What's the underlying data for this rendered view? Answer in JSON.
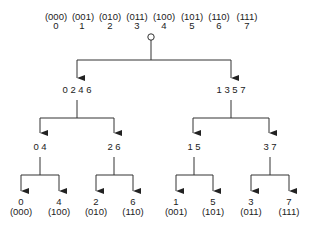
{
  "header": {
    "binary": [
      "(000)",
      "(001)",
      "(010)",
      "(011)",
      "(100)",
      "(101)",
      "(110)",
      "(111)"
    ],
    "decimal": [
      "0",
      "1",
      "2",
      "3",
      "4",
      "5",
      "6",
      "7"
    ]
  },
  "level1": [
    "0 2 4 6",
    "1 3 5 7"
  ],
  "level2": [
    "0 4",
    "2 6",
    "1 5",
    "3 7"
  ],
  "leaves": [
    {
      "value": "0",
      "binary": "(000)"
    },
    {
      "value": "4",
      "binary": "(100)"
    },
    {
      "value": "2",
      "binary": "(010)"
    },
    {
      "value": "6",
      "binary": "(110)"
    },
    {
      "value": "1",
      "binary": "(001)"
    },
    {
      "value": "5",
      "binary": "(101)"
    },
    {
      "value": "3",
      "binary": "(011)"
    },
    {
      "value": "7",
      "binary": "(111)"
    }
  ]
}
